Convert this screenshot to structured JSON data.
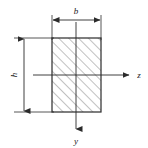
{
  "figure": {
    "background_color": "#ffffff",
    "line_color": "#2b2b2b",
    "hatch_color": "#8c8c8c",
    "label_color": "#1a1a1a"
  },
  "section": {
    "shape": "rectangle",
    "hatch_pattern": "45-degree-diagonal",
    "left_px": 52,
    "top_px": 38,
    "right_px": 101,
    "bottom_px": 112,
    "width_px": 49,
    "height_px": 74
  },
  "dimensions": {
    "width": {
      "label": "b",
      "orientation": "horizontal",
      "position": "top",
      "line_y_px": 20,
      "from_x_px": 52,
      "to_x_px": 101
    },
    "height": {
      "label": "h",
      "orientation": "vertical-rotated",
      "position": "left",
      "line_x_px": 24,
      "from_y_px": 38,
      "to_y_px": 112
    }
  },
  "axes": [
    {
      "label": "z",
      "orientation": "horizontal",
      "direction": "right",
      "line_y_px": 75,
      "from_x_px": 33,
      "to_x_px": 130,
      "label_x_px": 139,
      "label_y_px": 78
    },
    {
      "label": "y",
      "orientation": "vertical",
      "direction": "down",
      "line_x_px": 76,
      "from_y_px": 22,
      "to_y_px": 130,
      "label_x_px": 76,
      "label_y_px": 143
    }
  ],
  "origin": {
    "description": "centroid",
    "x_px": 76,
    "y_px": 75
  }
}
